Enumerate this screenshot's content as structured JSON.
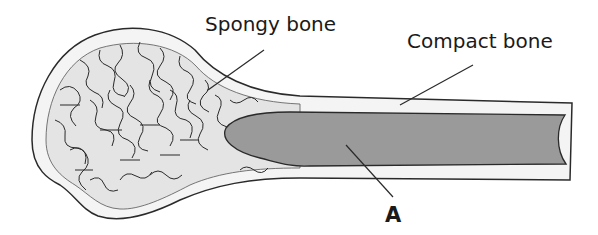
{
  "diagram": {
    "labels": {
      "spongy_bone": "Spongy bone",
      "compact_bone": "Compact bone",
      "marker_a": "A"
    },
    "colors": {
      "outline": "#2a2a2a",
      "compact_bone_fill": "#f4f4f4",
      "spongy_bone_fill": "#e4e4e4",
      "marrow_fill": "#9a9a9a"
    }
  }
}
